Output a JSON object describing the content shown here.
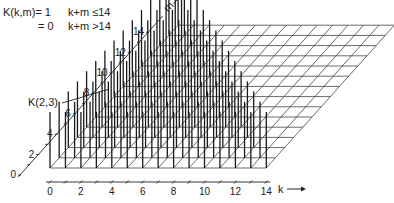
{
  "definition": {
    "line1_lhs": "K(k,m)= 1",
    "line1_cond": "k+m ≤14",
    "line2_lhs": "= 0",
    "line2_cond": "k+m >14"
  },
  "annotation": "K(2,3)",
  "annotated_point": {
    "k": 2,
    "m": 3
  },
  "k_axis": {
    "label": "k",
    "ticks": [
      "0",
      "2",
      "4",
      "6",
      "8",
      "10",
      "12",
      "14"
    ],
    "max": 14
  },
  "m_axis": {
    "label": "m",
    "ticks": [
      "0",
      "2",
      "4",
      "6",
      "8",
      "10",
      "12",
      "14"
    ],
    "max": 14
  },
  "threshold": 14,
  "colors": {
    "ink": "#222222",
    "grid": "#444444"
  }
}
